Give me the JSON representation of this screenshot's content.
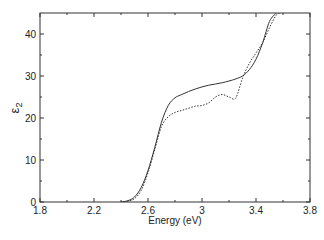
{
  "chart_data": {
    "type": "line",
    "title": "",
    "xlabel": "Energy (eV)",
    "ylabel": "ε2",
    "ylabel_main": "ε",
    "ylabel_sub": "2",
    "xlim": [
      1.8,
      3.8
    ],
    "ylim": [
      0,
      45
    ],
    "x_ticks": [
      1.8,
      2.2,
      2.6,
      3,
      3.4,
      3.8
    ],
    "x_tick_labels": [
      "1.8",
      "2.2",
      "2.6",
      "3",
      "3.4",
      "3.8"
    ],
    "x_minor_ticks": [
      2.0,
      2.4,
      2.8,
      3.2,
      3.6
    ],
    "y_ticks": [
      0,
      10,
      20,
      30,
      40
    ],
    "y_tick_labels": [
      "0",
      "10",
      "20",
      "30",
      "40"
    ],
    "y_minor_ticks": [
      5,
      15,
      25,
      35
    ],
    "grid": false,
    "legend": null,
    "series": [
      {
        "name": "solid",
        "style": "solid",
        "x": [
          2.4,
          2.45,
          2.5,
          2.55,
          2.6,
          2.65,
          2.7,
          2.75,
          2.8,
          2.85,
          2.9,
          2.95,
          3.0,
          3.05,
          3.1,
          3.15,
          3.2,
          3.25,
          3.3,
          3.35,
          3.4,
          3.45,
          3.5,
          3.55
        ],
        "y": [
          0.0,
          0.3,
          1.2,
          3.5,
          7.5,
          13.0,
          19.0,
          23.0,
          24.8,
          25.6,
          26.3,
          26.9,
          27.4,
          27.8,
          28.1,
          28.4,
          28.8,
          29.3,
          30.0,
          31.5,
          34.0,
          38.0,
          43.0,
          45.0
        ]
      },
      {
        "name": "dotted",
        "style": "dotted",
        "x": [
          2.4,
          2.45,
          2.5,
          2.55,
          2.6,
          2.65,
          2.7,
          2.75,
          2.8,
          2.85,
          2.9,
          2.95,
          3.0,
          3.05,
          3.1,
          3.15,
          3.2,
          3.25,
          3.3,
          3.35,
          3.4,
          3.45,
          3.5,
          3.55,
          3.58
        ],
        "y": [
          0.0,
          0.2,
          0.8,
          2.8,
          7.0,
          12.5,
          18.0,
          20.3,
          21.3,
          21.8,
          22.3,
          22.8,
          23.0,
          23.6,
          25.0,
          25.6,
          25.0,
          24.8,
          29.5,
          33.0,
          35.5,
          38.0,
          41.5,
          44.5,
          45.0
        ]
      }
    ]
  }
}
